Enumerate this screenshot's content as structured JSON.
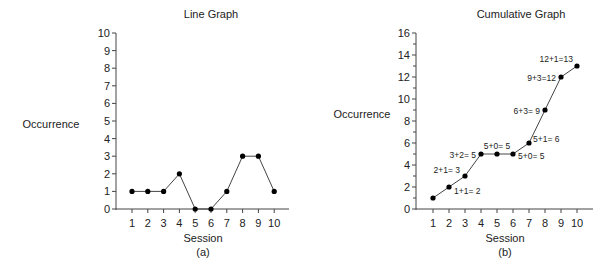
{
  "chart_data": [
    {
      "type": "line",
      "title": "Line Graph",
      "caption": "(a)",
      "xlabel": "Session",
      "ylabel": "Occurrence",
      "categories": [
        1,
        2,
        3,
        4,
        5,
        6,
        7,
        8,
        9,
        10
      ],
      "x": [
        1,
        2,
        3,
        4,
        5,
        6,
        7,
        8,
        9,
        10
      ],
      "values": [
        1,
        1,
        1,
        2,
        0,
        0,
        1,
        3,
        3,
        1
      ],
      "ylim": [
        0,
        10
      ],
      "yticks": [
        0,
        1,
        2,
        3,
        4,
        5,
        6,
        7,
        8,
        9,
        10
      ],
      "grid": false,
      "legend": null
    },
    {
      "type": "line",
      "title": "Cumulative Graph",
      "caption": "(b)",
      "xlabel": "Session",
      "ylabel": "Occurrence",
      "categories": [
        1,
        2,
        3,
        4,
        5,
        6,
        7,
        8,
        9,
        10
      ],
      "x": [
        1,
        2,
        3,
        4,
        5,
        6,
        7,
        8,
        9,
        10
      ],
      "values": [
        1,
        2,
        3,
        5,
        5,
        5,
        6,
        9,
        12,
        13
      ],
      "ylim": [
        0,
        16
      ],
      "yticks": [
        0,
        2,
        4,
        6,
        8,
        10,
        12,
        14,
        16
      ],
      "grid": false,
      "legend": null,
      "annotations": [
        {
          "x": 2,
          "text": "1+1= 2"
        },
        {
          "x": 3,
          "text": "2+1= 3"
        },
        {
          "x": 4,
          "text": "3+2= 5"
        },
        {
          "x": 5,
          "text": "5+0= 5"
        },
        {
          "x": 6,
          "text": "5+0= 5"
        },
        {
          "x": 7,
          "text": "5+1= 6"
        },
        {
          "x": 8,
          "text": "6+3= 9"
        },
        {
          "x": 9,
          "text": "9+3=12"
        },
        {
          "x": 10,
          "text": "12+1=13"
        }
      ]
    }
  ],
  "colors": {
    "line": "#444444",
    "marker": "#000000",
    "axis": "#444444",
    "text": "#222222"
  }
}
